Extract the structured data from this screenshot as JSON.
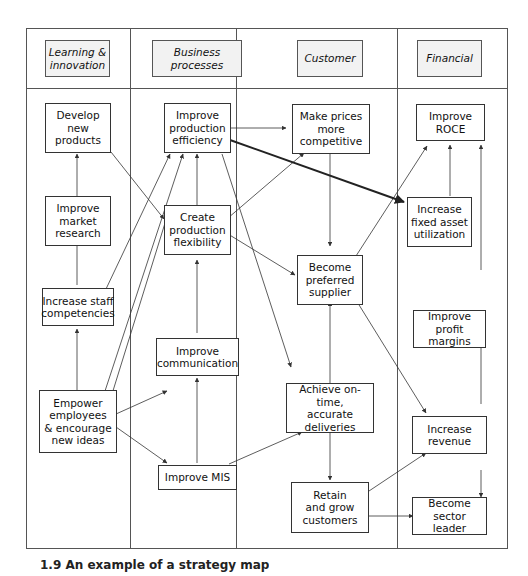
{
  "columns": [
    {
      "label": "Learning &\ninnovation"
    },
    {
      "label": "Business processes"
    },
    {
      "label": "Customer"
    },
    {
      "label": "Financial"
    }
  ],
  "nodes": {
    "develop_products": "Develop\nnew\nproducts",
    "market_research": "Improve\nmarket\nresearch",
    "staff_competencies": "Increase staff\ncompetencies",
    "empower": "Empower\nemployees\n& encourage\nnew ideas",
    "production_efficiency": "Improve\nproduction\nefficiency",
    "production_flexibility": "Create\nproduction\nflexibility",
    "communication": "Improve\ncommunication",
    "mis": "Improve MIS",
    "prices": "Make prices\nmore\ncompetitive",
    "preferred_supplier": "Become\npreferred\nsupplier",
    "deliveries": "Achieve on-time,\naccurate\ndeliveries",
    "retain_customers": "Retain\nand grow\ncustomers",
    "roce": "Improve\nROCE",
    "fixed_asset": "Increase\nfixed asset\nutilization",
    "profit_margins": "Improve profit\nmargins",
    "revenue": "Increase\nrevenue",
    "sector_leader": "Become\nsector leader"
  },
  "caption": "1.9  An example of a strategy map",
  "colors": {
    "line": "#333333",
    "header_bg": "#f2f2f2",
    "frame": "#555555"
  }
}
